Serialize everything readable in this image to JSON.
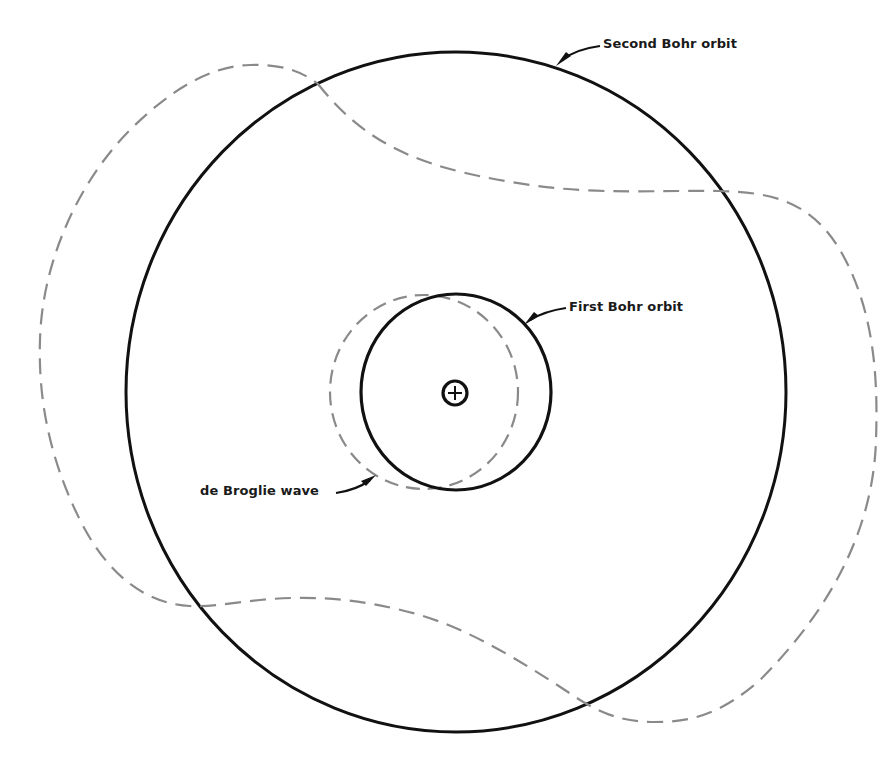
{
  "diagram": {
    "labels": {
      "second_orbit": "Second Bohr orbit",
      "first_orbit": "First Bohr orbit",
      "de_broglie_wave": "de Broglie wave"
    },
    "nucleus": {
      "symbol": "+",
      "description": "positively charged nucleus"
    },
    "elements": [
      {
        "name": "second-bohr-orbit",
        "style": "solid black",
        "shape": "circle"
      },
      {
        "name": "first-bohr-orbit",
        "style": "solid black",
        "shape": "circle"
      },
      {
        "name": "de-broglie-wave-first",
        "style": "dashed gray",
        "wavelengths": 1
      },
      {
        "name": "de-broglie-wave-second",
        "style": "dashed gray",
        "wavelengths": 2
      }
    ],
    "colors": {
      "orbit": "#111111",
      "wave": "#8a8a8a",
      "text": "#1a1a1a",
      "background": "#ffffff"
    }
  }
}
